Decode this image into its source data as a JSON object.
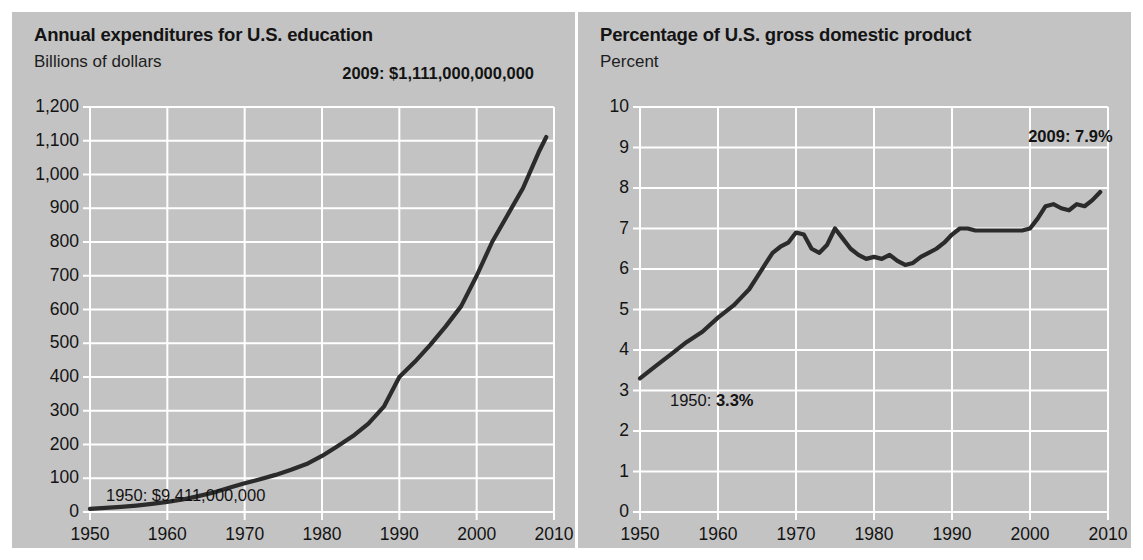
{
  "figure": {
    "background_color": "#ffffff",
    "panel_color": "#c3c3c3",
    "grid_color": "#ffffff",
    "line_color": "#2b2b2b",
    "text_color": "#131313"
  },
  "panels": [
    {
      "id": "education-expenditures",
      "title": "Annual expenditures for U.S. education",
      "subtitle": "Billions of dollars",
      "annotations": [
        {
          "id": "start",
          "text": "1950: $9,411,000,000",
          "bold": false
        },
        {
          "id": "end",
          "text": "2009: $1,111,000,000,000",
          "bold": true
        }
      ]
    },
    {
      "id": "percent-gdp",
      "title": "Percentage of U.S. gross domestic product",
      "subtitle": "Percent",
      "annotations": [
        {
          "id": "start",
          "text": "1950: ",
          "value": "3.3%",
          "bold": false
        },
        {
          "id": "end",
          "text": "2009: 7.9%",
          "bold": true
        }
      ]
    }
  ],
  "chart_data": [
    {
      "type": "line",
      "title": "Annual expenditures for U.S. education",
      "subtitle": "Billions of dollars",
      "xlabel": "",
      "ylabel": "Billions of dollars",
      "xlim": [
        1950,
        2010
      ],
      "ylim": [
        0,
        1200
      ],
      "ytick_labels": [
        "0",
        "100",
        "200",
        "300",
        "400",
        "500",
        "600",
        "700",
        "800",
        "900",
        "1,000",
        "1,100",
        "1,200"
      ],
      "yticks": [
        0,
        100,
        200,
        300,
        400,
        500,
        600,
        700,
        800,
        900,
        1000,
        1100,
        1200
      ],
      "xtick_labels": [
        "1950",
        "1960",
        "1970",
        "1980",
        "1990",
        "2000",
        "2010"
      ],
      "xticks": [
        1950,
        1960,
        1970,
        1980,
        1990,
        2000,
        2010
      ],
      "grid": true,
      "legend": "none",
      "x": [
        1950,
        1952,
        1954,
        1956,
        1958,
        1960,
        1962,
        1964,
        1966,
        1968,
        1970,
        1972,
        1974,
        1976,
        1978,
        1980,
        1982,
        1984,
        1986,
        1988,
        1990,
        1992,
        1994,
        1996,
        1998,
        2000,
        2002,
        2004,
        2006,
        2008,
        2009
      ],
      "values": [
        9.4,
        12,
        15,
        19,
        24,
        30,
        37,
        47,
        58,
        72,
        85,
        97,
        110,
        125,
        142,
        166,
        195,
        225,
        262,
        312,
        400,
        445,
        495,
        550,
        610,
        700,
        800,
        880,
        960,
        1065,
        1111
      ],
      "annotations": [
        {
          "x": 1950,
          "y": 9.4,
          "text": "1950: $9,411,000,000"
        },
        {
          "x": 2009,
          "y": 1111,
          "text": "2009: $1,111,000,000,000"
        }
      ]
    },
    {
      "type": "line",
      "title": "Percentage of U.S. gross domestic product",
      "subtitle": "Percent",
      "xlabel": "",
      "ylabel": "Percent",
      "xlim": [
        1950,
        2010
      ],
      "ylim": [
        0,
        10
      ],
      "ytick_labels": [
        "0",
        "1",
        "2",
        "3",
        "4",
        "5",
        "6",
        "7",
        "8",
        "9",
        "10"
      ],
      "yticks": [
        0,
        1,
        2,
        3,
        4,
        5,
        6,
        7,
        8,
        9,
        10
      ],
      "xtick_labels": [
        "1950",
        "1960",
        "1970",
        "1980",
        "1990",
        "2000",
        "2010"
      ],
      "xticks": [
        1950,
        1960,
        1970,
        1980,
        1990,
        2000,
        2010
      ],
      "grid": true,
      "legend": "none",
      "x": [
        1950,
        1952,
        1954,
        1956,
        1958,
        1960,
        1962,
        1963,
        1964,
        1965,
        1966,
        1967,
        1968,
        1969,
        1970,
        1971,
        1972,
        1973,
        1974,
        1975,
        1976,
        1977,
        1978,
        1979,
        1980,
        1981,
        1982,
        1983,
        1984,
        1985,
        1986,
        1987,
        1988,
        1989,
        1990,
        1991,
        1992,
        1993,
        1994,
        1995,
        1996,
        1997,
        1998,
        1999,
        2000,
        2001,
        2002,
        2003,
        2004,
        2005,
        2006,
        2007,
        2008,
        2009
      ],
      "values": [
        3.3,
        3.6,
        3.9,
        4.2,
        4.45,
        4.8,
        5.1,
        5.3,
        5.5,
        5.8,
        6.1,
        6.4,
        6.55,
        6.65,
        6.9,
        6.85,
        6.5,
        6.4,
        6.6,
        7.0,
        6.75,
        6.5,
        6.35,
        6.25,
        6.3,
        6.25,
        6.35,
        6.2,
        6.1,
        6.15,
        6.3,
        6.4,
        6.5,
        6.65,
        6.85,
        7.0,
        7.0,
        6.95,
        6.95,
        6.95,
        6.95,
        6.95,
        6.95,
        6.95,
        7.0,
        7.25,
        7.55,
        7.6,
        7.5,
        7.45,
        7.6,
        7.55,
        7.7,
        7.9
      ],
      "annotations": [
        {
          "x": 1950,
          "y": 3.3,
          "text": "1950: 3.3%"
        },
        {
          "x": 2009,
          "y": 7.9,
          "text": "2009: 7.9%"
        }
      ]
    }
  ]
}
